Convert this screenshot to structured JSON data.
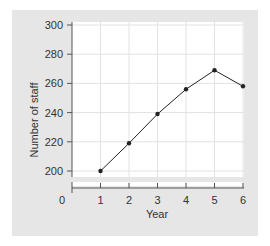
{
  "chart_data": {
    "type": "line",
    "title": "",
    "xlabel": "Year",
    "ylabel": "Number of staff",
    "x": [
      1,
      2,
      3,
      4,
      5,
      6
    ],
    "values": [
      200,
      219,
      239,
      256,
      269,
      258
    ],
    "x_ticks": [
      "0",
      "1",
      "2",
      "3",
      "4",
      "5",
      "6"
    ],
    "y_ticks": [
      "200",
      "220",
      "240",
      "260",
      "280",
      "300"
    ],
    "ylim": [
      200,
      300
    ],
    "xlim": [
      0,
      6
    ],
    "y_axis_break": true,
    "grid": true,
    "legend": null
  },
  "colors": {
    "panel_bg": "#e6e6e6",
    "plot_bg": "#ffffff",
    "grid": "#e2e2e2",
    "line": "#222222",
    "axis": "#555555"
  }
}
